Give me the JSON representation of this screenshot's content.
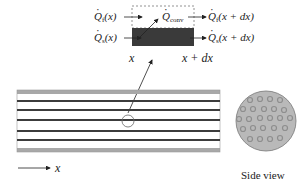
{
  "diagram": {
    "element": {
      "labels": {
        "qf_in": {
          "symbol": "Q",
          "sub": "f",
          "arg": "(x)"
        },
        "qs_in": {
          "symbol": "Q",
          "sub": "s",
          "arg": "(x)"
        },
        "qconv": {
          "symbol": "Q",
          "sub": "conv",
          "arg": ""
        },
        "qf_out": {
          "symbol": "Q",
          "sub": "f",
          "arg": "(x + dx)"
        },
        "qs_out": {
          "symbol": "Q",
          "sub": "s",
          "arg": "(x + dx)"
        },
        "x_left": "x",
        "x_right": "x + dx"
      }
    },
    "axis_label": "x",
    "side_view_label": "Side view",
    "colors": {
      "solid_block": "#3a3a3a",
      "pipe_border": "#a8a8a8",
      "tube_line": "#3c3c3c",
      "side_view_fill": "#b9b9b9",
      "side_view_dots": "#8e8e8e"
    }
  }
}
